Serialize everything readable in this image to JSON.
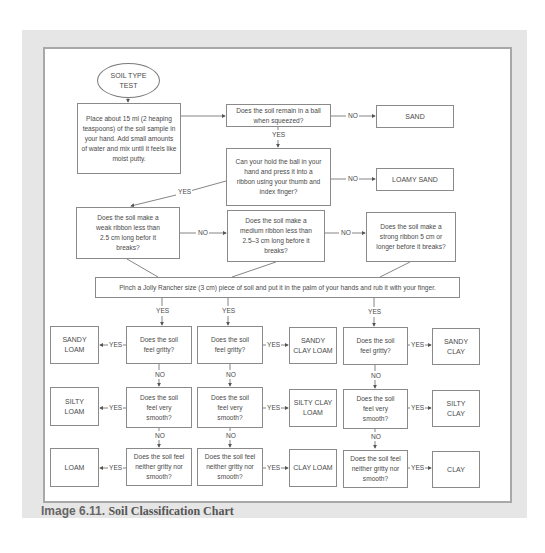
{
  "caption": {
    "number": "Image 6.11.",
    "title": "Soil Classification Chart"
  },
  "start": {
    "label_line1": "SOIL TYPE",
    "label_line2": "TEST"
  },
  "steps": {
    "prepare": "Place about 15 ml (2 heaping teaspoons) of the soil sample in your hand. Add small amounts of water and mix until it feels like moist putty.",
    "ball": "Does the soil remain in a ball when squeezed?",
    "ribbon": "Can your hold the ball in your hand and press it into a ribbon using your thumb and index finger?",
    "weak": "Does the soil make a weak ribbon less than 2.5 cm long befor it breaks?",
    "medium": "Does the soil make a medium ribbon less than 2.5–3 cm long before it breaks?",
    "strong": "Does the soil make a strong ribbon 5 cm or longer before it breaks?",
    "pinch": "Pinch a Jolly Rancher size (3 cm) piece of soil and put it in the palm of your hands and rub it with your finger."
  },
  "questions": {
    "gritty": "Does the soil feel gritty?",
    "smooth": "Does the soil feel very smooth?",
    "neither": "Does the soil feel neither gritty nor smooth?"
  },
  "results": {
    "sand": "SAND",
    "loamy_sand": "LOAMY SAND",
    "sandy_loam": "SANDY LOAM",
    "silty_loam": "SILTY LOAM",
    "loam": "LOAM",
    "sandy_clay_loam": "SANDY CLAY LOAM",
    "silty_clay_loam": "SILTY CLAY LOAM",
    "clay_loam": "CLAY LOAM",
    "sandy_clay": "SANDY CLAY",
    "silty_clay": "SILTY CLAY",
    "clay": "CLAY"
  },
  "labels": {
    "yes": "YES",
    "no": "NO",
    "yes_left": "◂YES",
    "yes_right": "YES▸",
    "no_arrow": "NO"
  }
}
